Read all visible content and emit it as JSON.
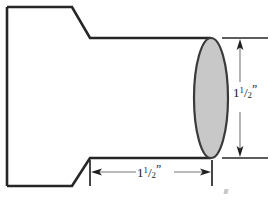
{
  "drawing": {
    "title": "Stepped cylindrical part - side view with dimensions",
    "background_color": "#ffffff",
    "line_color": "#262626",
    "dimension_line_color": "#555555",
    "end_face_fill_color": "#c8c8c8",
    "end_face_stroke_color": "#3a3a3a",
    "body": {
      "name": "stepped-shaft-profile",
      "left_edge_x": 7,
      "top_y": 7,
      "bottom_y": 186,
      "flange_right_x": 72,
      "chamfer_end_x": 90,
      "shaft_top_y": 38,
      "shaft_bottom_y": 158
    },
    "end_face": {
      "name": "circular-end-face",
      "center_x": 211,
      "center_y": 98,
      "radius_x": 17,
      "radius_y": 60
    }
  },
  "dimensions": {
    "vertical": {
      "name": "diameter-dimension",
      "value_whole": "1",
      "value_numerator": "1",
      "value_slash": "/",
      "value_denominator": "2",
      "unit_symbol": "”",
      "full_text": "1 1/2\"",
      "extension_top_y": 38,
      "extension_bottom_y": 158,
      "dimension_line_x": 240
    },
    "horizontal": {
      "name": "length-dimension",
      "value_whole": "1",
      "value_numerator": "1",
      "value_slash": "/",
      "value_denominator": "2",
      "unit_symbol": "”",
      "full_text": "1 1/2\"",
      "extension_left_x": 90,
      "extension_right_x": 212,
      "dimension_line_y": 172
    }
  },
  "artifact": {
    "name": "scan-artifact-mark",
    "description": "faint partial character at lower right"
  }
}
